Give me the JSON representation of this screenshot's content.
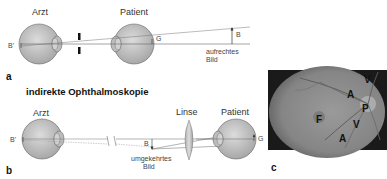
{
  "panel_a": {
    "label": "a",
    "doctor_label": "Arzt",
    "patient_label": "Patient",
    "image_point_label": "B'",
    "object_label": "G",
    "image_label": "B",
    "image_caption_line1": "aufrechtes",
    "image_caption_line2": "Bild"
  },
  "panel_b": {
    "label": "b",
    "title": "indirekte Ophthalmoskopie",
    "doctor_label": "Arzt",
    "lens_label": "Linse",
    "patient_label": "Patient",
    "image_point_label": "B'",
    "object_label": "G",
    "image_label": "B",
    "image_caption_line1": "umgekehrtes",
    "image_caption_line2": "Bild"
  },
  "panel_c": {
    "label": "c",
    "fundus_labels": [
      {
        "text": "V",
        "x": 364,
        "y": 79
      },
      {
        "text": "A",
        "x": 347,
        "y": 94
      },
      {
        "text": "P",
        "x": 362,
        "y": 108
      },
      {
        "text": "F",
        "x": 316,
        "y": 119
      },
      {
        "text": "V",
        "x": 353,
        "y": 124
      },
      {
        "text": "A",
        "x": 339,
        "y": 138
      }
    ]
  },
  "colors": {
    "eye_fill": "#c9c9c9",
    "eye_stroke": "#555555",
    "line": "#555555",
    "fundus_bg": "#1a1a1a",
    "fundus_disc": "#8f8f8f"
  }
}
